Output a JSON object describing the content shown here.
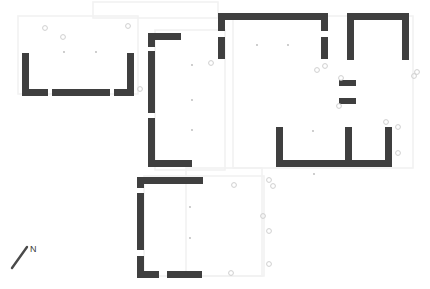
{
  "plan": {
    "title": "Archaeological Site Floor Plan",
    "canvas": {
      "width": 430,
      "height": 289
    },
    "background_color": "#ffffff",
    "wall_color": "#3f3f3f",
    "faint_outline_color": "#f2f2f2",
    "marker_stroke_color": "#cfcfcf",
    "dot_color": "#b8b8b8",
    "north_arrow": {
      "label": "N",
      "label_x": 30,
      "label_y": 252,
      "line_x1": 12,
      "line_y1": 268,
      "line_x2": 27,
      "line_y2": 247,
      "color": "#4a4a4a"
    },
    "rooms": [
      {
        "name": "west-room",
        "label": "West Room"
      },
      {
        "name": "central-spine-wall",
        "label": "Central Spine Wall"
      },
      {
        "name": "north-central-room",
        "label": "North Central Room"
      },
      {
        "name": "northeast-room",
        "label": "Northeast Room"
      },
      {
        "name": "east-twin-cells",
        "label": "East Twin Cells"
      },
      {
        "name": "passage-stubs",
        "label": "Passage Stubs"
      },
      {
        "name": "south-central-room",
        "label": "South Central Room"
      }
    ],
    "walls": [
      {
        "room": "west-room",
        "part": "west-wall",
        "x": 22,
        "y": 53,
        "w": 7,
        "h": 43
      },
      {
        "room": "west-room",
        "part": "south-wall-left",
        "x": 22,
        "y": 89,
        "w": 26,
        "h": 7
      },
      {
        "room": "west-room",
        "part": "south-wall-mid",
        "x": 52,
        "y": 89,
        "w": 58,
        "h": 7
      },
      {
        "room": "west-room",
        "part": "south-wall-right",
        "x": 114,
        "y": 89,
        "w": 20,
        "h": 7
      },
      {
        "room": "west-room",
        "part": "east-wall",
        "x": 127,
        "y": 53,
        "w": 7,
        "h": 43
      },
      {
        "room": "central-spine-wall",
        "part": "north-stub",
        "x": 148,
        "y": 33,
        "w": 33,
        "h": 7
      },
      {
        "room": "central-spine-wall",
        "part": "vertical-upper",
        "x": 148,
        "y": 33,
        "w": 7,
        "h": 14
      },
      {
        "room": "central-spine-wall",
        "part": "vertical-mid",
        "x": 148,
        "y": 51,
        "w": 7,
        "h": 62
      },
      {
        "room": "central-spine-wall",
        "part": "vertical-lower",
        "x": 148,
        "y": 118,
        "w": 7,
        "h": 48
      },
      {
        "room": "central-spine-wall",
        "part": "south-stub",
        "x": 148,
        "y": 160,
        "w": 44,
        "h": 7
      },
      {
        "room": "north-central-room",
        "part": "north-wall",
        "x": 218,
        "y": 13,
        "w": 110,
        "h": 7
      },
      {
        "room": "north-central-room",
        "part": "west-wall-upper",
        "x": 218,
        "y": 13,
        "w": 7,
        "h": 18
      },
      {
        "room": "north-central-room",
        "part": "west-wall-lower",
        "x": 218,
        "y": 37,
        "w": 7,
        "h": 22
      },
      {
        "room": "north-central-room",
        "part": "east-wall-upper",
        "x": 321,
        "y": 13,
        "w": 7,
        "h": 18
      },
      {
        "room": "north-central-room",
        "part": "east-wall-lower",
        "x": 321,
        "y": 37,
        "w": 7,
        "h": 22
      },
      {
        "room": "northeast-room",
        "part": "north-wall",
        "x": 347,
        "y": 13,
        "w": 62,
        "h": 7
      },
      {
        "room": "northeast-room",
        "part": "west-wall",
        "x": 347,
        "y": 13,
        "w": 7,
        "h": 47
      },
      {
        "room": "northeast-room",
        "part": "east-wall",
        "x": 402,
        "y": 13,
        "w": 7,
        "h": 47
      },
      {
        "room": "passage-stubs",
        "part": "upper-stub",
        "x": 339,
        "y": 80,
        "w": 17,
        "h": 6
      },
      {
        "room": "passage-stubs",
        "part": "lower-stub",
        "x": 339,
        "y": 98,
        "w": 17,
        "h": 6
      },
      {
        "room": "east-twin-cells",
        "part": "west-wall",
        "x": 276,
        "y": 127,
        "w": 7,
        "h": 40
      },
      {
        "room": "east-twin-cells",
        "part": "middle-wall",
        "x": 345,
        "y": 127,
        "w": 7,
        "h": 40
      },
      {
        "room": "east-twin-cells",
        "part": "east-wall",
        "x": 385,
        "y": 127,
        "w": 7,
        "h": 40
      },
      {
        "room": "east-twin-cells",
        "part": "south-wall",
        "x": 276,
        "y": 160,
        "w": 116,
        "h": 7
      },
      {
        "room": "south-central-room",
        "part": "north-wall",
        "x": 137,
        "y": 177,
        "w": 66,
        "h": 7
      },
      {
        "room": "south-central-room",
        "part": "west-wall-upper",
        "x": 137,
        "y": 177,
        "w": 7,
        "h": 11
      },
      {
        "room": "south-central-room",
        "part": "west-wall-mid",
        "x": 137,
        "y": 193,
        "w": 7,
        "h": 57
      },
      {
        "room": "south-central-room",
        "part": "west-wall-lower",
        "x": 137,
        "y": 256,
        "w": 7,
        "h": 22
      },
      {
        "room": "south-central-room",
        "part": "south-wall-left",
        "x": 137,
        "y": 271,
        "w": 22,
        "h": 7
      },
      {
        "room": "south-central-room",
        "part": "south-wall-right",
        "x": 167,
        "y": 271,
        "w": 35,
        "h": 7
      }
    ],
    "faint_outlines": [
      {
        "name": "north-footprint",
        "x": 93,
        "y": 2,
        "w": 125,
        "h": 16
      },
      {
        "name": "west-courtyard",
        "x": 18,
        "y": 16,
        "w": 120,
        "h": 78
      },
      {
        "name": "central-court",
        "x": 155,
        "y": 30,
        "w": 70,
        "h": 140
      },
      {
        "name": "east-footprint",
        "x": 233,
        "y": 16,
        "w": 180,
        "h": 152
      },
      {
        "name": "south-footprint",
        "x": 144,
        "y": 176,
        "w": 120,
        "h": 100
      },
      {
        "name": "southeast-strip",
        "x": 186,
        "y": 168,
        "w": 76,
        "h": 108
      }
    ],
    "markers": [
      {
        "x": 45,
        "y": 28
      },
      {
        "x": 63,
        "y": 37
      },
      {
        "x": 128,
        "y": 26
      },
      {
        "x": 140,
        "y": 89
      },
      {
        "x": 211,
        "y": 63
      },
      {
        "x": 317,
        "y": 70
      },
      {
        "x": 325,
        "y": 66
      },
      {
        "x": 341,
        "y": 78
      },
      {
        "x": 339,
        "y": 106
      },
      {
        "x": 417,
        "y": 72
      },
      {
        "x": 398,
        "y": 127
      },
      {
        "x": 398,
        "y": 153
      },
      {
        "x": 386,
        "y": 122
      },
      {
        "x": 269,
        "y": 180
      },
      {
        "x": 234,
        "y": 185
      },
      {
        "x": 273,
        "y": 186
      },
      {
        "x": 263,
        "y": 216
      },
      {
        "x": 269,
        "y": 231
      },
      {
        "x": 269,
        "y": 264
      },
      {
        "x": 231,
        "y": 273
      },
      {
        "x": 414,
        "y": 76
      }
    ],
    "dots": [
      {
        "x": 64,
        "y": 52
      },
      {
        "x": 96,
        "y": 52
      },
      {
        "x": 192,
        "y": 65
      },
      {
        "x": 192,
        "y": 100
      },
      {
        "x": 192,
        "y": 130
      },
      {
        "x": 257,
        "y": 45
      },
      {
        "x": 288,
        "y": 45
      },
      {
        "x": 313,
        "y": 131
      },
      {
        "x": 314,
        "y": 174
      },
      {
        "x": 190,
        "y": 207
      },
      {
        "x": 190,
        "y": 238
      }
    ]
  }
}
